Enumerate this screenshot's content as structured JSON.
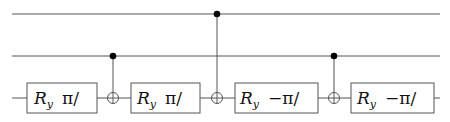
{
  "circuit": {
    "num_qubits": 3,
    "wires": [
      {
        "name": "qubit-0"
      },
      {
        "name": "qubit-1"
      },
      {
        "name": "qubit-2"
      }
    ],
    "gates": [
      {
        "type": "rotation",
        "qubit": 2,
        "symbol": "R",
        "subscript": "y",
        "arg": "π/"
      },
      {
        "type": "cnot",
        "control": 1,
        "target": 2
      },
      {
        "type": "rotation",
        "qubit": 2,
        "symbol": "R",
        "subscript": "y",
        "arg": "π/"
      },
      {
        "type": "cnot",
        "control": 0,
        "target": 2
      },
      {
        "type": "rotation",
        "qubit": 2,
        "symbol": "R",
        "subscript": "y",
        "arg": "−π/"
      },
      {
        "type": "cnot",
        "control": 1,
        "target": 2
      },
      {
        "type": "rotation",
        "qubit": 2,
        "symbol": "R",
        "subscript": "y",
        "arg": "−π/"
      }
    ]
  },
  "colors": {
    "wire": "#555555",
    "control_dot": "#000000",
    "background": "#ffffff"
  }
}
